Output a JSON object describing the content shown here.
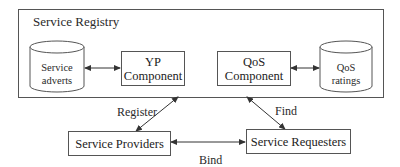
{
  "diagram": {
    "registry": {
      "label": "Service Registry"
    },
    "stores": [
      {
        "id": "service-adverts",
        "line1": "Service",
        "line2": "adverts"
      },
      {
        "id": "qos-ratings",
        "line1": "QoS",
        "line2": "ratings"
      }
    ],
    "components": [
      {
        "id": "yp",
        "line1": "YP",
        "line2": "Component"
      },
      {
        "id": "qos",
        "line1": "QoS",
        "line2": "Component"
      }
    ],
    "actors": {
      "providers": "Service Providers",
      "requesters": "Service Requesters"
    },
    "edges": {
      "register": "Register",
      "find": "Find",
      "bind": "Bind"
    },
    "colors": {
      "line": "#444444",
      "text": "#2a2a2a",
      "background": "#ffffff"
    }
  }
}
